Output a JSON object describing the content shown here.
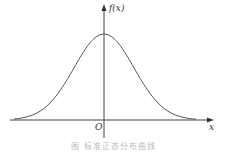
{
  "chart_data": {
    "type": "line",
    "title": "",
    "caption": "图    标准正态分布曲线",
    "xlabel": "x",
    "ylabel": "f(x)",
    "origin_label": "O",
    "curve": "bell-shaped normal density, symmetric about y-axis, peak at x=0",
    "grid": false,
    "legend": null,
    "colors": {
      "curve": "#555555",
      "axis": "#444444"
    }
  },
  "labels": {
    "y_axis": "f(x)",
    "x_axis": "x",
    "origin": "O",
    "caption": "图    标准正态分布曲线"
  }
}
